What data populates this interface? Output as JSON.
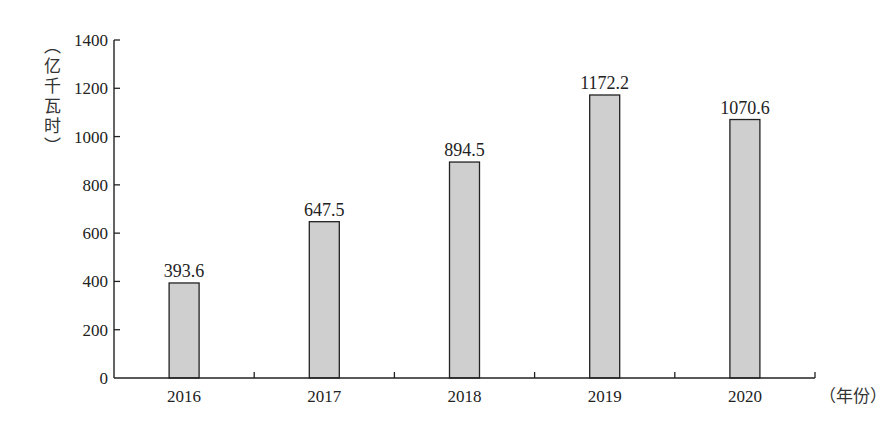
{
  "chart_data": {
    "type": "bar",
    "title": "",
    "xlabel": "（年份）",
    "ylabel": "（亿千瓦时）",
    "ylabel_chars": [
      "︵",
      "亿",
      "千",
      "瓦",
      "时",
      "︶"
    ],
    "categories": [
      "2016",
      "2017",
      "2018",
      "2019",
      "2020"
    ],
    "values": [
      393.6,
      647.5,
      894.5,
      1172.2,
      1070.6
    ],
    "data_labels": [
      "393.6",
      "647.5",
      "894.5",
      "1172.2",
      "1070.6"
    ],
    "ylim": [
      0,
      1400
    ],
    "yticks": [
      0,
      200,
      400,
      600,
      800,
      1000,
      1200,
      1400
    ],
    "grid": false,
    "bar_color": "#cfcfcf"
  }
}
